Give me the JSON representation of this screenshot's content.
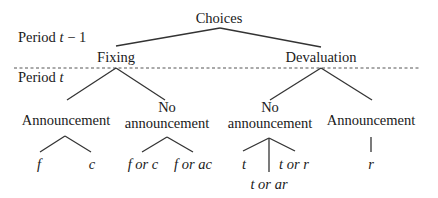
{
  "diagram": {
    "type": "decision-tree",
    "periods": {
      "previous": "Period t − 1",
      "previous_parts": {
        "word": "Period ",
        "var": "t",
        "rest": " − 1"
      },
      "current": "Period t",
      "current_parts": {
        "word": "Period ",
        "var": "t"
      }
    },
    "root": {
      "label": "Choices",
      "children": [
        {
          "label": "Fixing",
          "children": [
            {
              "label": "Announcement",
              "outcomes": [
                "f",
                "c"
              ]
            },
            {
              "label_line1": "No",
              "label_line2": "announcement",
              "outcomes": [
                "f or c",
                "f or ac"
              ]
            }
          ]
        },
        {
          "label": "Devaluation",
          "children": [
            {
              "label_line1": "No",
              "label_line2": "announcement",
              "outcomes": [
                "t",
                "t or ar",
                "t or r"
              ]
            },
            {
              "label": "Announcement",
              "outcomes": [
                "r"
              ]
            }
          ]
        }
      ]
    },
    "colors": {
      "line": "#333333",
      "text": "#1a1a1a",
      "divider": "#555555"
    }
  }
}
